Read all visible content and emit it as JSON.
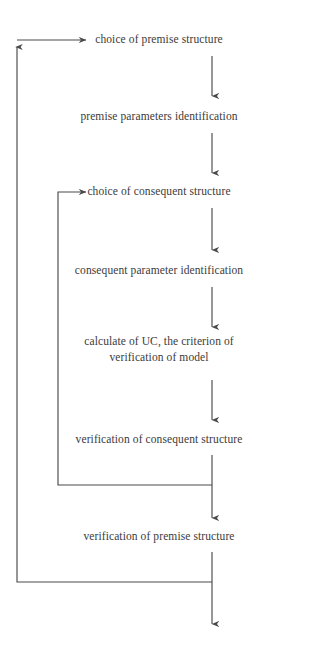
{
  "diagram": {
    "type": "flowchart",
    "title": "",
    "orientation": "vertical",
    "line_color": "#4a4a4a",
    "text_color": "#3b3b3b",
    "background_color": "#ffffff",
    "nodes": [
      {
        "id": "n1",
        "label": "choice of premise structure",
        "x": 212,
        "y": 40
      },
      {
        "id": "n2",
        "label": "premise parameters identification",
        "x": 212,
        "y": 117
      },
      {
        "id": "n3",
        "label": "choice of consequent structure",
        "x": 212,
        "y": 192
      },
      {
        "id": "n4",
        "label": "consequent parameter identification",
        "x": 212,
        "y": 271
      },
      {
        "id": "n5",
        "label_line1": "calculate of UC, the criterion of",
        "label_line2": "verification of model",
        "x": 212,
        "y": 348
      },
      {
        "id": "n6",
        "label": "verification of consequent structure",
        "x": 212,
        "y": 440
      },
      {
        "id": "n7",
        "label": "verification of premise structure",
        "x": 212,
        "y": 537
      }
    ],
    "edges": [
      {
        "from": "n1",
        "to": "n2",
        "kind": "arrow-down"
      },
      {
        "from": "n2",
        "to": "n3",
        "kind": "arrow-down"
      },
      {
        "from": "n3",
        "to": "n4",
        "kind": "arrow-down"
      },
      {
        "from": "n4",
        "to": "n5",
        "kind": "arrow-down"
      },
      {
        "from": "n5",
        "to": "n6",
        "kind": "arrow-down"
      },
      {
        "from": "n6",
        "to": "n7",
        "kind": "arrow-down"
      },
      {
        "from": "n7",
        "to": "exit",
        "kind": "arrow-down"
      },
      {
        "from": "n6",
        "to": "n3",
        "kind": "feedback-loop-inner"
      },
      {
        "from": "n7",
        "to": "n1",
        "kind": "feedback-loop-outer"
      }
    ]
  }
}
